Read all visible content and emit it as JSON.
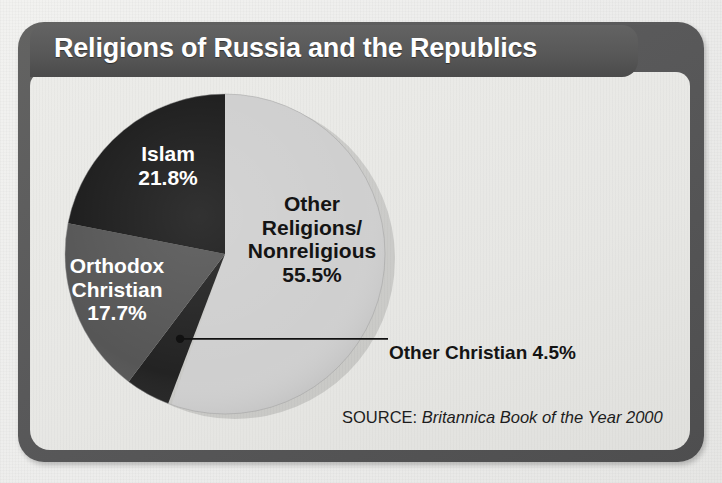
{
  "title": "Religions of Russia and the Republics",
  "source": {
    "prefix": "SOURCE: ",
    "publication": "Britannica Book of the Year 2000"
  },
  "labels": {
    "islam": "Islam\n21.8%",
    "orthodox": "Orthodox\nChristian\n17.7%",
    "other_religions": "Other\nReligions/\nNonreligious\n55.5%",
    "other_christian": "Other Christian 4.5%"
  },
  "colors": {
    "frame": "#58585a",
    "panel": "#e8e8e5",
    "title_text": "#ffffff",
    "other_religions": "#cfcfcf",
    "other_christian": "#232323",
    "orthodox_christian": "#565656",
    "islam": "#1b1b1b",
    "leader_line": "#111111"
  },
  "chart_data": {
    "type": "pie",
    "title": "Religions of Russia and the Republics",
    "xlabel": "",
    "ylabel": "",
    "units": "percent",
    "start_angle_deg": 0,
    "direction": "clockwise",
    "legend": "none (labels placed on slices)",
    "grid": false,
    "annotations": [
      "Other Christian 4.5% connected by a leader line to its slice",
      "SOURCE: Britannica Book of the Year 2000"
    ],
    "categories": [
      "Other Religions/Nonreligious",
      "Other Christian",
      "Orthodox Christian",
      "Islam"
    ],
    "values": [
      55.5,
      4.5,
      17.7,
      21.8
    ],
    "slices": [
      {
        "label": "Other Religions/Nonreligious",
        "value": 55.5,
        "display": "55.5%",
        "color": "#cfcfcf",
        "text_color": "#141414",
        "start_deg": 0,
        "end_deg": 199.8
      },
      {
        "label": "Other Christian",
        "value": 4.5,
        "display": "4.5%",
        "color": "#232323",
        "text_color": "#141414",
        "start_deg": 199.8,
        "end_deg": 216.0
      },
      {
        "label": "Orthodox Christian",
        "value": 17.7,
        "display": "17.7%",
        "color": "#565656",
        "text_color": "#ffffff",
        "start_deg": 216.0,
        "end_deg": 279.72
      },
      {
        "label": "Islam",
        "value": 21.8,
        "display": "21.8%",
        "color": "#1b1b1b",
        "text_color": "#ffffff",
        "start_deg": 279.72,
        "end_deg": 358.2
      }
    ]
  }
}
